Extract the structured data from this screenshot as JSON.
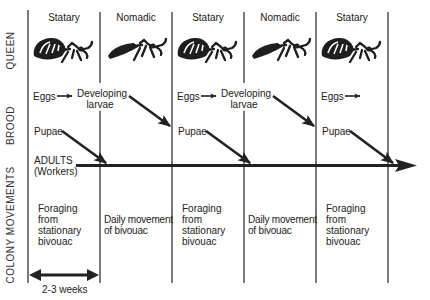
{
  "diagram": {
    "row_labels": {
      "queen": "QUEEN",
      "brood": "BROOD",
      "colony_movements": "COLONY MOVEMENTS"
    },
    "phases": [
      {
        "label": "Statary",
        "queen_state": "physogastric"
      },
      {
        "label": "Nomadic",
        "queen_state": "contracted"
      },
      {
        "label": "Statary",
        "queen_state": "physogastric"
      },
      {
        "label": "Nomadic",
        "queen_state": "contracted"
      },
      {
        "label": "Statary",
        "queen_state": "physogastric"
      }
    ],
    "brood": {
      "eggs": "Eggs",
      "developing_line1": "Developing",
      "developing_line2": "larvae",
      "pupae": "Pupae",
      "adults_line1": "ADULTS",
      "adults_line2": "(Workers)"
    },
    "colony_movements": {
      "statary_text": [
        "Foraging",
        "from",
        "stationary",
        "bivouac"
      ],
      "nomadic_text": [
        "Daily movement",
        "of bivouac"
      ]
    },
    "duration_label": "2-3 weeks",
    "colors": {
      "line": "#222222",
      "text": "#222222",
      "background": "#ffffff"
    }
  }
}
